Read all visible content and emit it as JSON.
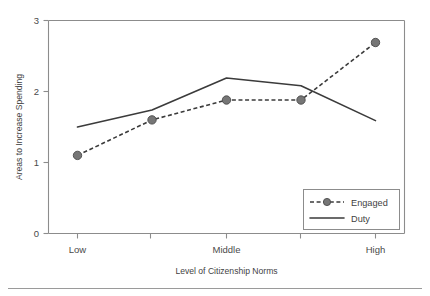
{
  "chart_data": {
    "type": "line",
    "title": "",
    "xlabel": "Level of Citizenship Norms",
    "ylabel": "Areas to Increase Spending",
    "categories": [
      "Low",
      "",
      "Middle",
      "",
      "High"
    ],
    "x_tick_labels": [
      "Low",
      "Middle",
      "High"
    ],
    "y_tick_labels": [
      "0",
      "1",
      "2",
      "3"
    ],
    "ylim": [
      0,
      3
    ],
    "yticks": [
      0,
      1,
      2,
      3
    ],
    "grid": false,
    "legend_position": "bottom-right",
    "series": [
      {
        "name": "Engaged",
        "style": "dashed",
        "markers": true,
        "values": [
          1.1,
          1.6,
          1.88,
          1.88,
          2.69
        ]
      },
      {
        "name": "Duty",
        "style": "solid",
        "markers": false,
        "values": [
          1.5,
          1.74,
          2.19,
          2.08,
          1.59
        ]
      }
    ],
    "colors": {
      "line": "#3b3b3b",
      "marker_fill": "#767676",
      "axis": "#8c8c8c",
      "text": "#3f3f3f",
      "background": "#ffffff"
    }
  },
  "legend": {
    "entries": [
      {
        "label": "Engaged"
      },
      {
        "label": "Duty"
      }
    ]
  },
  "axes": {
    "y_label": "Areas to Increase Spending",
    "x_label": "Level of Citizenship Norms",
    "y_ticks": [
      "3",
      "2",
      "1",
      "0"
    ],
    "x_ticks": [
      "Low",
      "Middle",
      "High"
    ]
  }
}
